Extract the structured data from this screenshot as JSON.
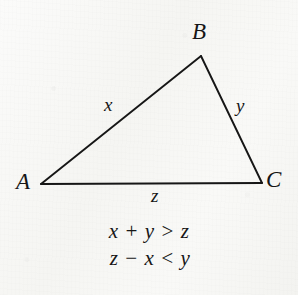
{
  "figure": {
    "kind": "geometry-diagram",
    "background_color": "#f7f7f5",
    "ink_color": "#161616",
    "triangle": {
      "name": "triangle-abc",
      "stroke_width_px": 1.8,
      "vertices": [
        {
          "label": "A",
          "x": 41,
          "y": 184
        },
        {
          "label": "B",
          "x": 201,
          "y": 56
        },
        {
          "label": "C",
          "x": 262,
          "y": 183
        }
      ],
      "sides": [
        {
          "label": "x",
          "from": "A",
          "to": "B"
        },
        {
          "label": "y",
          "from": "B",
          "to": "C"
        },
        {
          "label": "z",
          "from": "A",
          "to": "C"
        }
      ]
    },
    "vertex_labels": {
      "a": "A",
      "b": "B",
      "c": "C"
    },
    "side_labels": {
      "x": "x",
      "y": "y",
      "z": "z"
    },
    "equations": [
      "x + y > z",
      "z − x < y"
    ]
  }
}
